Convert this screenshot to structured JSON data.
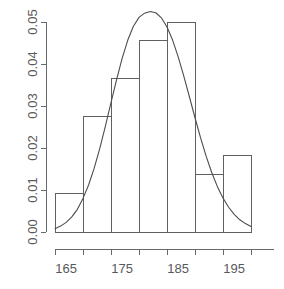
{
  "chart_data": {
    "type": "bar",
    "title": "",
    "subtitle": "",
    "xlabel": "",
    "ylabel": "",
    "grid": false,
    "legend": null,
    "legend_position": "none",
    "xlim": [
      163,
      198
    ],
    "ylim": [
      0.0,
      0.05
    ],
    "x_tick_labels": [
      "165",
      "175",
      "185",
      "195"
    ],
    "x_tick_values": [
      165,
      175,
      185,
      195
    ],
    "x_minor_tick_values": [
      170,
      180,
      190
    ],
    "y_tick_labels": [
      "0.00",
      "0.01",
      "0.02",
      "0.03",
      "0.04",
      "0.05"
    ],
    "y_tick_values": [
      0.0,
      0.01,
      0.02,
      0.03,
      0.04,
      0.05
    ],
    "bin_width": 5,
    "bin_edges": [
      163,
      168,
      173,
      178,
      183,
      188,
      193,
      198
    ],
    "categories": [
      "163-168",
      "168-173",
      "173-178",
      "178-183",
      "183-188",
      "188-193",
      "193-198"
    ],
    "values": [
      0.0091,
      0.0274,
      0.0365,
      0.0457,
      0.05,
      0.0137,
      0.0183
    ],
    "series": [
      {
        "name": "density",
        "type": "line",
        "x": [
          163.0,
          164.0,
          165.0,
          166.0,
          167.0,
          168.0,
          169.0,
          170.0,
          171.0,
          172.0,
          173.0,
          174.0,
          175.0,
          176.0,
          177.0,
          178.0,
          179.0,
          180.0,
          181.0,
          182.0,
          183.0,
          184.0,
          185.0,
          186.0,
          187.0,
          188.0,
          189.0,
          190.0,
          191.0,
          192.0,
          193.0,
          194.0,
          195.0,
          196.0,
          197.0,
          198.0
        ],
        "values": [
          0.0008,
          0.0014,
          0.0023,
          0.0036,
          0.0054,
          0.008,
          0.0112,
          0.0152,
          0.0199,
          0.0252,
          0.0308,
          0.0363,
          0.0414,
          0.0457,
          0.049,
          0.0511,
          0.0521,
          0.0525,
          0.0522,
          0.051,
          0.0488,
          0.0457,
          0.0417,
          0.0371,
          0.0322,
          0.0272,
          0.0224,
          0.018,
          0.0141,
          0.0108,
          0.0081,
          0.0059,
          0.0042,
          0.0029,
          0.002,
          0.0013
        ]
      }
    ]
  }
}
